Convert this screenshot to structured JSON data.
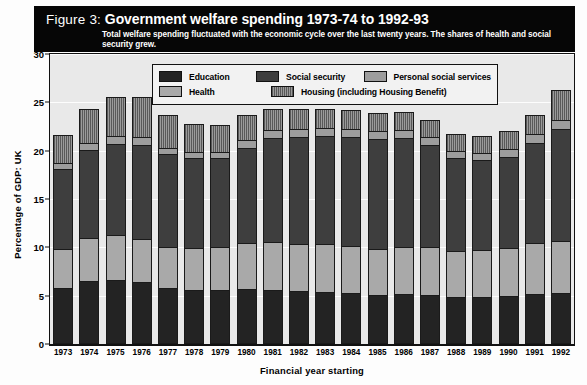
{
  "figure": {
    "label": "Figure 3:",
    "title": "Government welfare spending 1973-74 to 1992-93",
    "subtitle": "Total welfare spending fluctuated with the economic cycle over the last twenty years. The shares of health and social security grew."
  },
  "legend": {
    "items": [
      {
        "label": "Education",
        "swatch": "education-swatch",
        "color": "#232323",
        "pattern": "solid"
      },
      {
        "label": "Social security",
        "swatch": "social-security-swatch",
        "color": "#3e3e3e",
        "pattern": "solid"
      },
      {
        "label": "Personal social services",
        "swatch": "personal-social-services-swatch",
        "color": "#9d9d9d",
        "pattern": "solid"
      },
      {
        "label": "Health",
        "swatch": "health-swatch",
        "color": "#a9a9a9",
        "pattern": "solid"
      },
      {
        "label": "Housing (including Housing Benefit)",
        "swatch": "housing-swatch",
        "color": "#585858",
        "pattern": "vertical-hatch"
      }
    ]
  },
  "chart_data": {
    "type": "bar",
    "stacked": true,
    "title": "Government welfare spending 1973-74 to 1992-93",
    "subtitle": "Total welfare spending fluctuated with the economic cycle over the last twenty years. The shares of health and social security grew.",
    "xlabel": "Financial year starting",
    "ylabel": "Percentage of GDP: UK",
    "ylim": [
      0,
      30
    ],
    "yticks": [
      0,
      5,
      10,
      15,
      20,
      25,
      30
    ],
    "grid": true,
    "legend_position": "top-center-inside",
    "categories": [
      "1973",
      "1974",
      "1975",
      "1976",
      "1977",
      "1978",
      "1979",
      "1980",
      "1981",
      "1982",
      "1983",
      "1984",
      "1985",
      "1986",
      "1987",
      "1988",
      "1989",
      "1990",
      "1991",
      "1992"
    ],
    "series": [
      {
        "name": "Education",
        "color": "#232323",
        "values": [
          5.6,
          6.3,
          6.4,
          6.2,
          5.6,
          5.4,
          5.4,
          5.5,
          5.4,
          5.3,
          5.2,
          5.1,
          4.9,
          5.0,
          4.9,
          4.7,
          4.7,
          4.8,
          5.0,
          5.1
        ]
      },
      {
        "name": "Health",
        "color": "#a9a9a9",
        "values": [
          4.0,
          4.5,
          4.7,
          4.5,
          4.2,
          4.3,
          4.4,
          4.7,
          4.9,
          4.8,
          4.9,
          4.8,
          4.7,
          4.8,
          4.9,
          4.7,
          4.8,
          4.9,
          5.2,
          5.3
        ]
      },
      {
        "name": "Social security",
        "color": "#3e3e3e",
        "values": [
          8.3,
          9.1,
          9.4,
          9.7,
          9.6,
          9.3,
          9.2,
          9.9,
          10.8,
          11.1,
          11.2,
          11.3,
          11.4,
          11.3,
          10.6,
          9.6,
          9.3,
          9.4,
          10.4,
          11.6
        ]
      },
      {
        "name": "Personal social services",
        "color": "#9d9d9d",
        "values": [
          0.6,
          0.7,
          0.8,
          0.8,
          0.7,
          0.7,
          0.7,
          0.8,
          0.8,
          0.8,
          0.8,
          0.8,
          0.8,
          0.8,
          0.8,
          0.8,
          0.8,
          0.9,
          0.9,
          1.0
        ]
      },
      {
        "name": "Housing (including Housing Benefit)",
        "color": "#585858",
        "pattern": "vertical-hatch",
        "values": [
          2.9,
          3.5,
          4.1,
          4.1,
          3.4,
          2.9,
          2.8,
          2.6,
          2.2,
          2.1,
          2.0,
          2.0,
          1.9,
          1.9,
          1.8,
          1.7,
          1.7,
          1.8,
          2.0,
          3.1
        ]
      }
    ],
    "totals": [
      21.4,
      24.1,
      25.4,
      25.3,
      23.5,
      22.6,
      22.5,
      23.5,
      24.1,
      24.1,
      24.1,
      24.0,
      23.7,
      23.8,
      23.0,
      21.5,
      21.3,
      21.8,
      23.5,
      26.1
    ]
  }
}
